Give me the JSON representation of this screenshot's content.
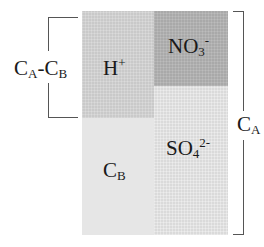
{
  "diagram": {
    "blocks": {
      "h_plus": {
        "base": "H",
        "sup": "+"
      },
      "nitrate": {
        "base": "NO",
        "sub": "3",
        "sup": "-"
      },
      "cb": {
        "base": "C",
        "sub": "B"
      },
      "sulfate": {
        "base": "SO",
        "sub": "4",
        "sup": "2-"
      }
    },
    "left_bracket_label": {
      "c1": "C",
      "s1": "A",
      "dash": "-",
      "c2": "C",
      "s2": "B"
    },
    "right_bracket_label": {
      "base": "C",
      "sub": "A"
    },
    "colors": {
      "h_plus": "#c9c9c9",
      "nitrate": "#a9a9a9",
      "cb": "#e6e6e6",
      "sulfate": "#dadada",
      "bracket": "#555555"
    }
  }
}
